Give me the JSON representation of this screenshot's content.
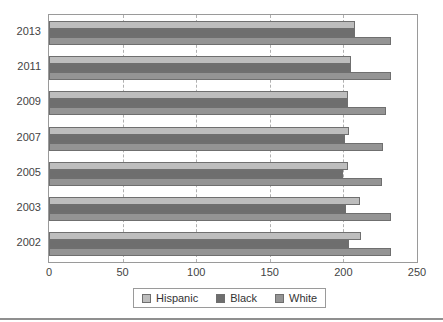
{
  "chart_data": {
    "type": "bar",
    "orientation": "horizontal",
    "title": "",
    "subtitle": "",
    "xlabel": "",
    "ylabel": "",
    "categories": [
      "2013",
      "2011",
      "2009",
      "2007",
      "2005",
      "2003",
      "2002"
    ],
    "series": [
      {
        "name": "Hispanic",
        "color": "#bdbdbd",
        "values": [
          208,
          205,
          203,
          204,
          203,
          211,
          212
        ]
      },
      {
        "name": "Black",
        "color": "#6e6e6e",
        "values": [
          208,
          205,
          203,
          201,
          200,
          202,
          204
        ]
      },
      {
        "name": "White",
        "color": "#949494",
        "values": [
          232,
          232,
          229,
          227,
          226,
          232,
          232
        ]
      }
    ],
    "xlim": [
      0,
      250
    ],
    "xticks": [
      0,
      50,
      100,
      150,
      200,
      250
    ],
    "xtick_labels": [
      "0",
      "50",
      "100",
      "150",
      "200",
      "250"
    ],
    "grid": true,
    "grid_axis": "x",
    "grid_style": "dashed",
    "legend_position": "bottom",
    "legend": [
      "Hispanic",
      "Black",
      "White"
    ]
  },
  "legend": {
    "items": [
      {
        "label": "Hispanic"
      },
      {
        "label": "Black"
      },
      {
        "label": "White"
      }
    ]
  }
}
